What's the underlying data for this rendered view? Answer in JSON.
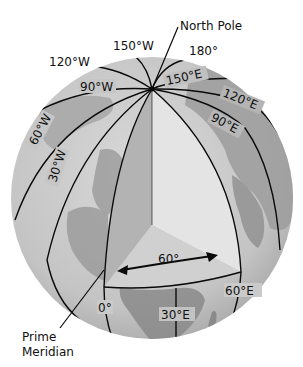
{
  "diagram": {
    "type": "globe-longitude",
    "colors": {
      "ocean": "#c9c9c9",
      "land_dark": "#8e8e8e",
      "land_mid": "#a9a9a9",
      "wedge_left_face": "#b3b3b3",
      "wedge_right_face": "#e6e6e6",
      "wedge_bottom_face": "#d2d2d2",
      "lines": "#0a0a0a"
    },
    "labels": {
      "north_pole": "North Pole",
      "prime_meridian_line1": "Prime",
      "prime_meridian_line2": "Meridian",
      "angle": "60°"
    },
    "meridians": [
      {
        "id": "150W",
        "label": "150°W"
      },
      {
        "id": "180",
        "label": "180°"
      },
      {
        "id": "120W",
        "label": "120°W"
      },
      {
        "id": "90W",
        "label": "90°W"
      },
      {
        "id": "60W",
        "label": "60°W"
      },
      {
        "id": "30W",
        "label": "30°W"
      },
      {
        "id": "0",
        "label": "0°"
      },
      {
        "id": "30E",
        "label": "30°E"
      },
      {
        "id": "60E",
        "label": "60°E"
      },
      {
        "id": "90E",
        "label": "90°E"
      },
      {
        "id": "120E",
        "label": "120°E"
      },
      {
        "id": "150E",
        "label": "150°E"
      }
    ]
  }
}
